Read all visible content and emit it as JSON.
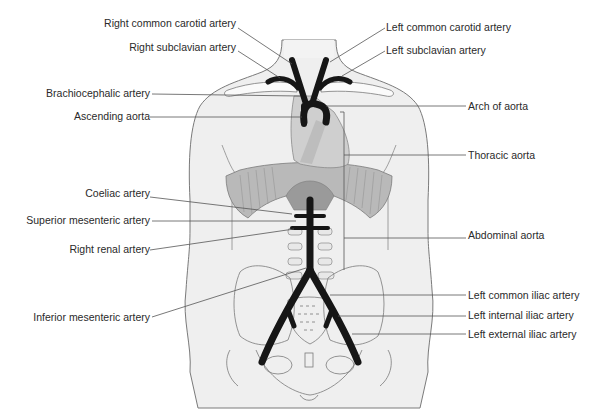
{
  "diagram": {
    "colors": {
      "body_fill": "#efefef",
      "outline": "#7a7a7a",
      "artery": "#161616",
      "heart": "#cfcfcf",
      "diaphragm": "#b4b4b4",
      "leader_line": "#555555",
      "text": "#2a2a2a"
    },
    "labels_left": [
      {
        "id": "right-common-carotid",
        "text": "Right common carotid artery"
      },
      {
        "id": "right-subclavian",
        "text": "Right subclavian artery"
      },
      {
        "id": "brachiocephalic",
        "text": "Brachiocephalic artery"
      },
      {
        "id": "ascending-aorta",
        "text": "Ascending aorta"
      },
      {
        "id": "coeliac",
        "text": "Coeliac artery"
      },
      {
        "id": "superior-mesenteric",
        "text": "Superior mesenteric artery"
      },
      {
        "id": "right-renal",
        "text": "Right renal artery"
      },
      {
        "id": "inferior-mesenteric",
        "text": "Inferior mesenteric artery"
      }
    ],
    "labels_right": [
      {
        "id": "left-common-carotid",
        "text": "Left common carotid artery"
      },
      {
        "id": "left-subclavian",
        "text": "Left subclavian artery"
      },
      {
        "id": "arch-of-aorta",
        "text": "Arch of aorta"
      },
      {
        "id": "thoracic-aorta",
        "text": "Thoracic aorta"
      },
      {
        "id": "abdominal-aorta",
        "text": "Abdominal aorta"
      },
      {
        "id": "left-common-iliac",
        "text": "Left common iliac artery"
      },
      {
        "id": "left-internal-iliac",
        "text": "Left internal iliac artery"
      },
      {
        "id": "left-external-iliac",
        "text": "Left external iliac artery"
      }
    ]
  }
}
